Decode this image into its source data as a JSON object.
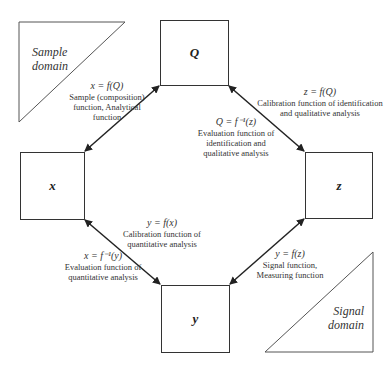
{
  "diagram": {
    "nodes": {
      "Q": {
        "label": "Q"
      },
      "x": {
        "label": "x"
      },
      "z": {
        "label": "z"
      },
      "y": {
        "label": "y"
      }
    },
    "domains": {
      "sample": {
        "line1": "Sample",
        "line2": "domain"
      },
      "signal": {
        "line1": "Signal",
        "line2": "domain"
      }
    },
    "edges": {
      "x_Q": {
        "equation": "x = f(Q)",
        "desc1": "Sample (composition)",
        "desc2": "function, Analytical",
        "desc3": "function"
      },
      "Q_z_forward": {
        "equation": "z = f(Q)",
        "desc1": "Calibration function of identification",
        "desc2": "and qualitative analysis"
      },
      "Q_z_inverse": {
        "equation": "Q = f⁻¹(z)",
        "desc1": "Evaluation function of",
        "desc2": "identification and",
        "desc3": "qualitative analysis"
      },
      "x_y_forward": {
        "equation": "y = f(x)",
        "desc1": "Calibration function of",
        "desc2": "quantitative analysis"
      },
      "x_y_inverse": {
        "equation": "x = f⁻¹(y)",
        "desc1": "Evaluation function of",
        "desc2": "quantitative analysis"
      },
      "z_y": {
        "equation": "y = f(z)",
        "desc1": "Signal function,",
        "desc2": "Measuring function"
      }
    },
    "colors": {
      "stroke": "#333333",
      "background": "#ffffff"
    }
  }
}
